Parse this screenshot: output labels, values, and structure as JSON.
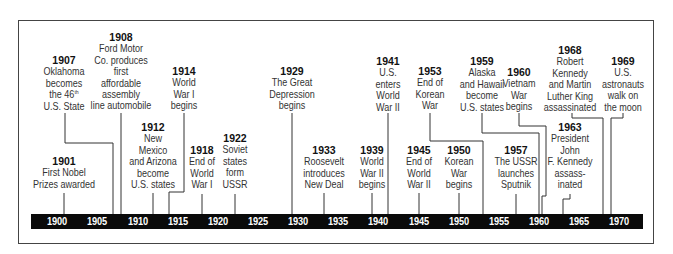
{
  "diagram": {
    "type": "timeline",
    "axis": {
      "start_year": 1900,
      "end_year": 1970,
      "tick_labels": [
        "1900",
        "1905",
        "1910",
        "1915",
        "1920",
        "1925",
        "1930",
        "1935",
        "1940",
        "1945",
        "1950",
        "1955",
        "1960",
        "1965",
        "1970"
      ],
      "bar_color": "#0a0a0a",
      "label_color": "#ffffff"
    },
    "events": [
      {
        "year": "1901",
        "lines": [
          "First Nobel",
          "Prizes awarded"
        ]
      },
      {
        "year": "1907",
        "lines": [
          "Oklahoma",
          "becomes",
          "the 46th",
          "U.S. State"
        ]
      },
      {
        "year": "1908",
        "lines": [
          "Ford Motor",
          "Co. produces",
          "first",
          "affordable",
          "assembly",
          "line automobile"
        ]
      },
      {
        "year": "1912",
        "lines": [
          "New",
          "Mexico",
          "and Arizona",
          "become",
          "U.S. states"
        ]
      },
      {
        "year": "1914",
        "lines": [
          "World",
          "War I",
          "begins"
        ]
      },
      {
        "year": "1918",
        "lines": [
          "End of",
          "World",
          "War I"
        ]
      },
      {
        "year": "1922",
        "lines": [
          "Soviet",
          "states",
          "form",
          "USSR"
        ]
      },
      {
        "year": "1929",
        "lines": [
          "The Great",
          "Depression",
          "begins"
        ]
      },
      {
        "year": "1933",
        "lines": [
          "Roosevelt",
          "introduces",
          "New Deal"
        ]
      },
      {
        "year": "1939",
        "lines": [
          "World",
          "War II",
          "begins"
        ]
      },
      {
        "year": "1941",
        "lines": [
          "U.S.",
          "enters",
          "World",
          "War II"
        ]
      },
      {
        "year": "1945",
        "lines": [
          "End of",
          "World",
          "War II"
        ]
      },
      {
        "year": "1950",
        "lines": [
          "Korean",
          "War",
          "begins"
        ]
      },
      {
        "year": "1953",
        "lines": [
          "End of",
          "Korean",
          "War"
        ]
      },
      {
        "year": "1957",
        "lines": [
          "The USSR",
          "launches",
          "Sputnik"
        ]
      },
      {
        "year": "1959",
        "lines": [
          "Alaska",
          "and Hawaii",
          "become",
          "U.S. states"
        ]
      },
      {
        "year": "1960",
        "lines": [
          "Vietnam",
          "War",
          "begins"
        ]
      },
      {
        "year": "1963",
        "lines": [
          "President",
          "John",
          "F. Kennedy",
          "assass-",
          "inated"
        ]
      },
      {
        "year": "1968",
        "lines": [
          "Robert",
          "Kennedy",
          "and Martin",
          "Luther King",
          "assassinated"
        ]
      },
      {
        "year": "1969",
        "lines": [
          "U.S.",
          "astronauts",
          "walk on",
          "the moon"
        ]
      }
    ]
  }
}
